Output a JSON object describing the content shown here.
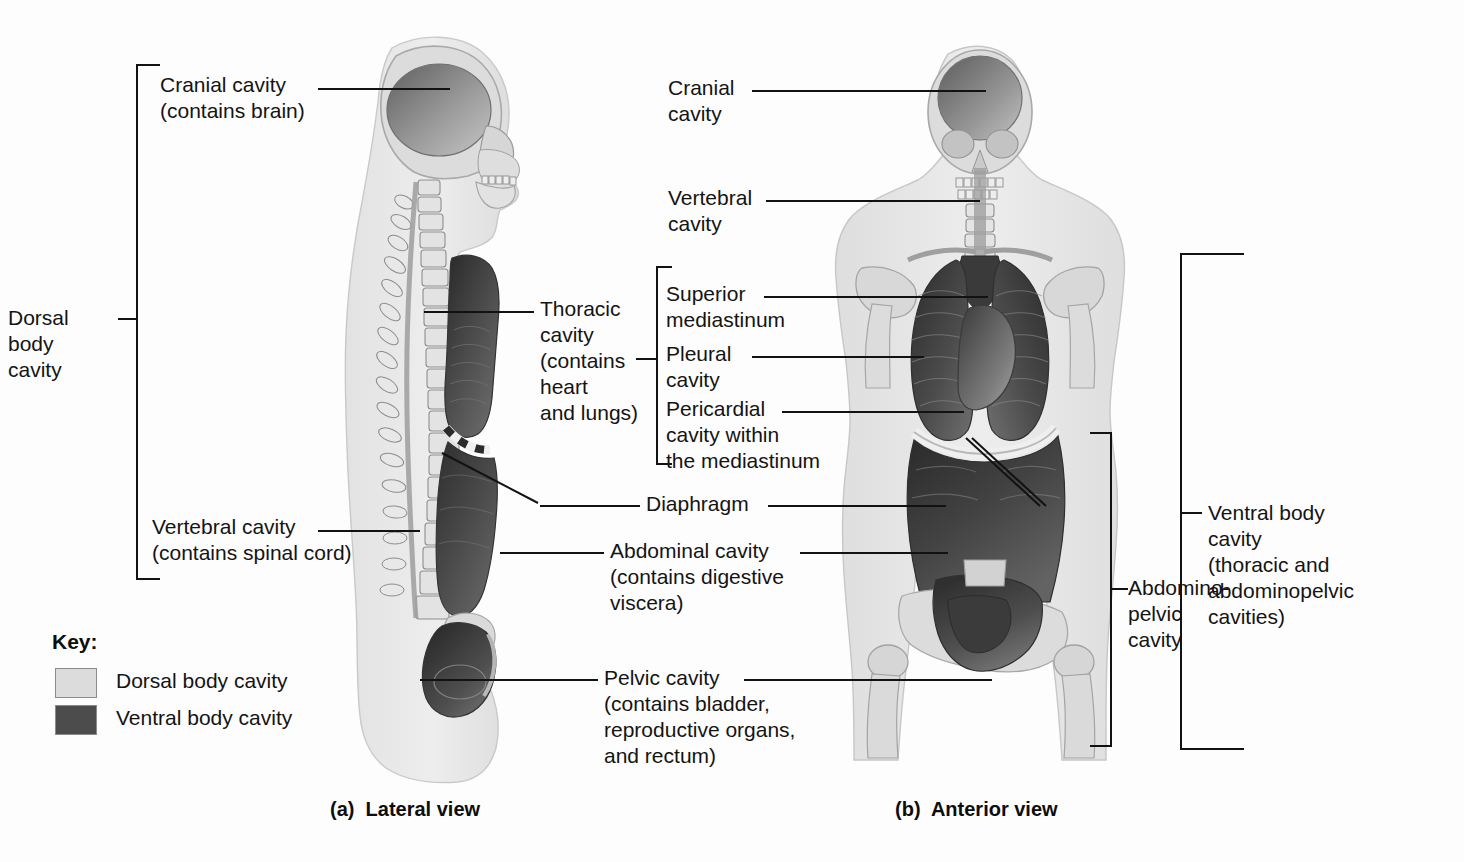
{
  "figure": {
    "background": "#fdfdfd",
    "colors": {
      "dorsal_cavity": "#d9d9d9",
      "ventral_cavity": "#4a4a4a",
      "body_outline": "#e6e6e6",
      "bone": "#cfcfcf",
      "line": "#121212",
      "text": "#141414"
    }
  },
  "key": {
    "title": "Key:",
    "items": [
      {
        "label": "Dorsal body cavity",
        "color": "#dcdcdc"
      },
      {
        "label": "Ventral body cavity",
        "color": "#4c4c4c"
      }
    ]
  },
  "captions": {
    "lateral": "(a)  Lateral view",
    "anterior": "(b)  Anterior view"
  },
  "lateral_view": {
    "labels": {
      "cranial": "Cranial cavity\n(contains brain)",
      "dorsal_bracket": "Dorsal\nbody\ncavity",
      "vertebral": "Vertebral cavity\n(contains spinal cord)",
      "thoracic": "Thoracic\ncavity\n(contains\nheart\nand lungs)"
    }
  },
  "anterior_view": {
    "labels": {
      "cranial": "Cranial\ncavity",
      "vertebral": "Vertebral\ncavity",
      "superior_mediastinum": "Superior\nmediastinum",
      "pleural": "Pleural\ncavity",
      "pericardial": "Pericardial\ncavity within\nthe mediastinum",
      "abdominopelvic_bracket": "Abdomino-\npelvic\ncavity",
      "ventral_bracket": "Ventral body\ncavity\n(thoracic and\nabdominopelvic\ncavities)"
    }
  },
  "shared_labels": {
    "diaphragm": "Diaphragm",
    "abdominal": "Abdominal cavity\n(contains digestive\nviscera)",
    "pelvic": "Pelvic cavity\n(contains bladder,\nreproductive organs,\nand rectum)"
  }
}
